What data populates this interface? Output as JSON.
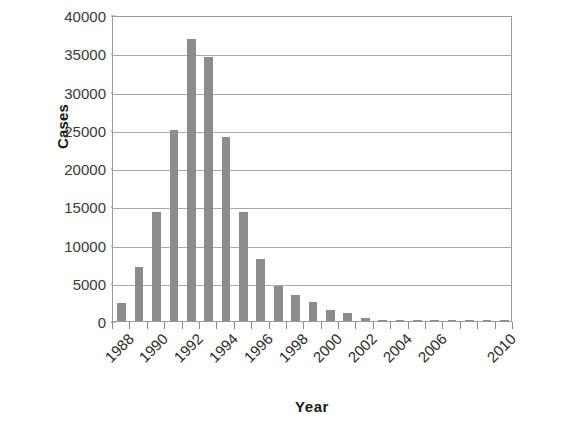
{
  "chart_data": {
    "type": "bar",
    "title": "",
    "xlabel": "Year",
    "ylabel": "Cases",
    "categories": [
      "1988",
      "1989",
      "1990",
      "1991",
      "1992",
      "1993",
      "1994",
      "1995",
      "1996",
      "1997",
      "1998",
      "1999",
      "2000",
      "2001",
      "2002",
      "2003",
      "2004",
      "2005",
      "2006",
      "2007",
      "2008",
      "2009",
      "2010"
    ],
    "values": [
      2300,
      7000,
      14200,
      25000,
      36800,
      34500,
      24000,
      14300,
      8100,
      4600,
      3400,
      2500,
      1400,
      1000,
      350,
      150,
      90,
      60,
      50,
      40,
      30,
      25,
      20
    ],
    "ylim": [
      0,
      40000
    ],
    "ytick_labels": [
      "40000",
      "35000",
      "30000",
      "25000",
      "20000",
      "15000",
      "10000",
      "5000",
      "0"
    ],
    "ytick_values": [
      40000,
      35000,
      30000,
      25000,
      20000,
      15000,
      10000,
      5000,
      0
    ],
    "xtick_labels": [
      "1988",
      "1990",
      "1992",
      "1994",
      "1996",
      "1998",
      "2000",
      "2002",
      "2004",
      "2006",
      "2010"
    ],
    "xtick_categories": [
      "1988",
      "1990",
      "1992",
      "1994",
      "1996",
      "1998",
      "2000",
      "2002",
      "2004",
      "2006",
      "2010"
    ],
    "grid": "horizontal",
    "legend": "none",
    "bar_color": "#8c8c8c",
    "grid_color": "#a8a8a8",
    "axis_color": "#9a9a9a",
    "text_color": "#1a1a1a"
  }
}
